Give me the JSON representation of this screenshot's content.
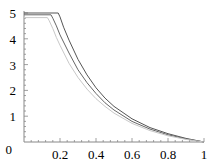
{
  "chart_data": {
    "type": "line",
    "title": "",
    "xlabel": "",
    "ylabel": "",
    "xlim": [
      0,
      1
    ],
    "ylim": [
      0,
      5
    ],
    "grid": false,
    "legend": null,
    "x_ticks": [
      {
        "value": 0.2,
        "label": "0.2"
      },
      {
        "value": 0.4,
        "label": "0.4"
      },
      {
        "value": 0.6,
        "label": "0.6"
      },
      {
        "value": 0.8,
        "label": "0.8"
      },
      {
        "value": 1,
        "label": "1"
      }
    ],
    "y_ticks": [
      {
        "value": 0,
        "label": "0"
      },
      {
        "value": 1,
        "label": "1"
      },
      {
        "value": 2,
        "label": "2"
      },
      {
        "value": 3,
        "label": "3"
      },
      {
        "value": 4,
        "label": "4"
      },
      {
        "value": 5,
        "label": "5"
      }
    ],
    "series": [
      {
        "name": "curve-1",
        "color": "#555555",
        "x": [
          0.0,
          0.19,
          0.2,
          0.22,
          0.25,
          0.3,
          0.35,
          0.4,
          0.45,
          0.5,
          0.6,
          0.7,
          0.8,
          0.9,
          1.0
        ],
        "y": [
          5.0,
          5.0,
          4.85,
          4.45,
          3.95,
          3.2,
          2.6,
          2.1,
          1.7,
          1.38,
          0.9,
          0.56,
          0.32,
          0.14,
          0.0
        ]
      },
      {
        "name": "curve-2",
        "color": "#666666",
        "x": [
          0.0,
          0.15,
          0.16,
          0.18,
          0.2,
          0.25,
          0.3,
          0.35,
          0.4,
          0.45,
          0.5,
          0.6,
          0.7,
          0.8,
          0.9,
          1.0
        ],
        "y": [
          4.93,
          4.93,
          4.8,
          4.5,
          4.15,
          3.45,
          2.8,
          2.3,
          1.88,
          1.52,
          1.24,
          0.8,
          0.5,
          0.28,
          0.12,
          0.0
        ]
      },
      {
        "name": "curve-3",
        "color": "#c8c8c8",
        "x": [
          0.0,
          0.13,
          0.14,
          0.16,
          0.18,
          0.2,
          0.25,
          0.3,
          0.35,
          0.4,
          0.45,
          0.5,
          0.6,
          0.7,
          0.8,
          0.9,
          1.0
        ],
        "y": [
          4.82,
          4.82,
          4.7,
          4.4,
          4.05,
          3.75,
          3.05,
          2.5,
          2.05,
          1.68,
          1.38,
          1.12,
          0.72,
          0.44,
          0.24,
          0.1,
          0.0
        ]
      }
    ]
  },
  "layout": {
    "origin_px": [
      24,
      142
    ],
    "x_scale_px": 180,
    "y_scale_px": 25.8
  }
}
